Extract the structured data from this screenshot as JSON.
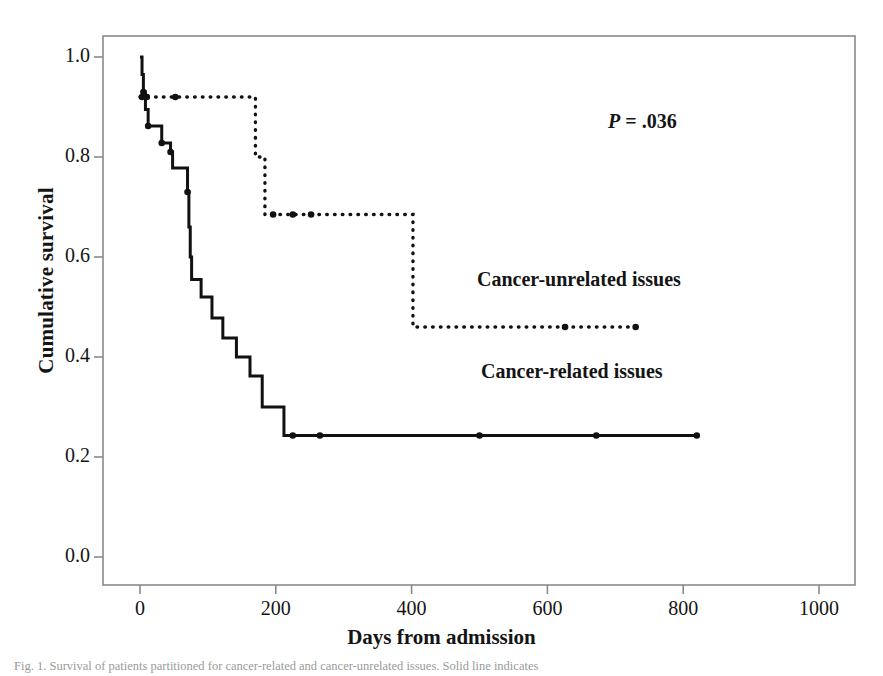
{
  "figure": {
    "caption_partial": "Fig. 1. Survival of patients partitioned for cancer-related and cancer-unrelated issues. Solid line indicates"
  },
  "axes": {
    "x_title": "Days from admission",
    "y_title": "Cumulative survival",
    "x_ticks": [
      "0",
      "200",
      "400",
      "600",
      "800",
      "1000"
    ],
    "y_ticks": [
      "0.0",
      "0.2",
      "0.4",
      "0.6",
      "0.8",
      "1.0"
    ]
  },
  "annotations": {
    "p_label": "P",
    "p_equals": " = ",
    "p_value": ".036",
    "series_label_unrelated": "Cancer-unrelated issues",
    "series_label_related": "Cancer-related issues"
  },
  "colors": {
    "line": "#111111",
    "frame": "#8a8a8a",
    "text": "#141414"
  },
  "chart_data": {
    "type": "line",
    "title": "",
    "xlabel": "Days from admission",
    "ylabel": "Cumulative survival",
    "xlim": [
      -35,
      1030
    ],
    "ylim": [
      -0.04,
      1.04
    ],
    "grid": false,
    "legend": "inline-annotations",
    "curve_style": "kaplan-meier-step",
    "series": [
      {
        "name": "Cancer-related issues",
        "style": "solid",
        "final_survival": 0.243,
        "max_followup_days": 820,
        "steps": [
          {
            "x": 0,
            "y": 1.0
          },
          {
            "x": 3,
            "y": 0.965
          },
          {
            "x": 5,
            "y": 0.93
          },
          {
            "x": 8,
            "y": 0.895
          },
          {
            "x": 12,
            "y": 0.862
          },
          {
            "x": 30,
            "y": 0.862
          },
          {
            "x": 32,
            "y": 0.828
          },
          {
            "x": 45,
            "y": 0.81
          },
          {
            "x": 48,
            "y": 0.778
          },
          {
            "x": 68,
            "y": 0.778
          },
          {
            "x": 70,
            "y": 0.73
          },
          {
            "x": 72,
            "y": 0.66
          },
          {
            "x": 74,
            "y": 0.6
          },
          {
            "x": 76,
            "y": 0.555
          },
          {
            "x": 88,
            "y": 0.555
          },
          {
            "x": 90,
            "y": 0.52
          },
          {
            "x": 104,
            "y": 0.52
          },
          {
            "x": 106,
            "y": 0.478
          },
          {
            "x": 120,
            "y": 0.478
          },
          {
            "x": 122,
            "y": 0.438
          },
          {
            "x": 140,
            "y": 0.438
          },
          {
            "x": 142,
            "y": 0.4
          },
          {
            "x": 160,
            "y": 0.4
          },
          {
            "x": 162,
            "y": 0.362
          },
          {
            "x": 178,
            "y": 0.362
          },
          {
            "x": 180,
            "y": 0.3
          },
          {
            "x": 210,
            "y": 0.3
          },
          {
            "x": 212,
            "y": 0.243
          },
          {
            "x": 820,
            "y": 0.243
          }
        ],
        "censor_marks_days": [
          5,
          12,
          32,
          45,
          70,
          225,
          265,
          500,
          672,
          820
        ]
      },
      {
        "name": "Cancer-unrelated issues",
        "style": "dotted",
        "final_survival": 0.46,
        "max_followup_days": 730,
        "steps": [
          {
            "x": 0,
            "y": 0.92
          },
          {
            "x": 168,
            "y": 0.92
          },
          {
            "x": 170,
            "y": 0.8
          },
          {
            "x": 182,
            "y": 0.8
          },
          {
            "x": 184,
            "y": 0.685
          },
          {
            "x": 400,
            "y": 0.685
          },
          {
            "x": 402,
            "y": 0.46
          },
          {
            "x": 730,
            "y": 0.46
          }
        ],
        "censor_marks_days": [
          3,
          10,
          52,
          196,
          225,
          252,
          626,
          730
        ]
      }
    ]
  }
}
